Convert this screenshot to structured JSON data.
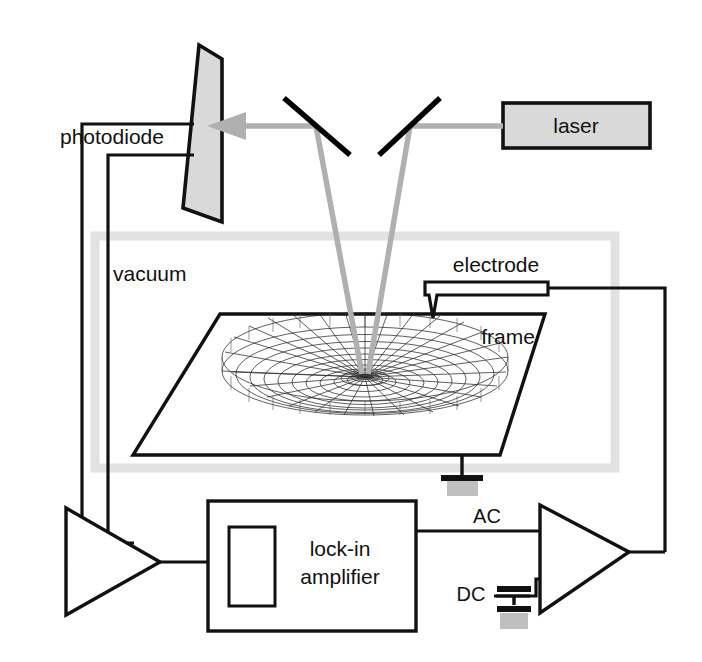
{
  "figure": {
    "type": "schematic-diagram",
    "canvas": {
      "width": 702,
      "height": 662
    },
    "background_color": "#ffffff",
    "line_color": "#111111",
    "beam_color": "#b0b0b0",
    "fill_gray": "#d9d9d9",
    "vacuum_border_color": "#e2e2e2"
  },
  "labels": {
    "photodiode": "photodiode",
    "laser": "laser",
    "vacuum": "vacuum",
    "electrode": "electrode",
    "frame": "frame",
    "lockin_line1": "lock-in",
    "lockin_line2": "amplifier",
    "ac": "AC",
    "dc": "DC"
  },
  "components": {
    "photodiode": {
      "name": "photodiode",
      "shape": "parallelogram",
      "fill": "#d9d9d9"
    },
    "laser": {
      "name": "laser",
      "shape": "rectangle",
      "fill": "#d9d9d9"
    },
    "mirrors": [
      {
        "name": "mirror-left"
      },
      {
        "name": "mirror-right"
      }
    ],
    "vacuum_chamber": {
      "name": "vacuum",
      "shape": "rectangle-outline"
    },
    "frame": {
      "name": "frame",
      "shape": "parallelogram-plate"
    },
    "membrane": {
      "name": "membrane",
      "shape": "radial-wireframe-mesh",
      "radial_spokes": 24,
      "rings": 10,
      "deflection": "center-depressed"
    },
    "electrode": {
      "name": "electrode",
      "shape": "tapered-probe"
    },
    "lockin_amplifier": {
      "name": "lock-in amplifier",
      "shape": "rectangle"
    },
    "amplifier_left": {
      "name": "amplifier",
      "shape": "triangle-right"
    },
    "amplifier_right": {
      "name": "amplifier",
      "shape": "triangle-right"
    },
    "capacitor": {
      "name": "capacitor",
      "shape": "parallel-plates"
    },
    "grounds": [
      {
        "name": "ground-frame"
      },
      {
        "name": "ground-dc"
      }
    ]
  }
}
